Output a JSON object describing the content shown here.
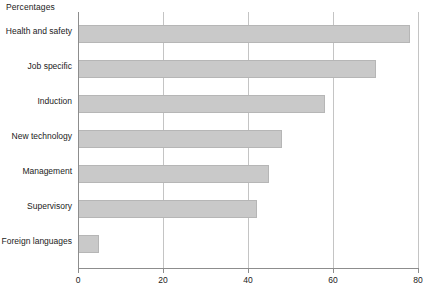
{
  "chart_data": {
    "type": "bar",
    "orientation": "horizontal",
    "title": "Percentages",
    "xlabel": "",
    "ylabel": "",
    "xlim": [
      0,
      80
    ],
    "xticks": [
      0,
      20,
      40,
      60,
      80
    ],
    "xtick_labels": [
      "0",
      "20",
      "40",
      "60",
      "80"
    ],
    "grid": "vertical",
    "legend": "none",
    "bar_color": "#c9c9c9",
    "bar_edge_color": "#b6b6b6",
    "axis_color": "#8d8d8d",
    "gridline_color": "#c4c4c4",
    "categories": [
      "Health and safety",
      "Job specific",
      "Induction",
      "New technology",
      "Management",
      "Supervisory",
      "Foreign languages"
    ],
    "values": [
      78,
      70,
      58,
      48,
      45,
      42,
      5
    ]
  }
}
